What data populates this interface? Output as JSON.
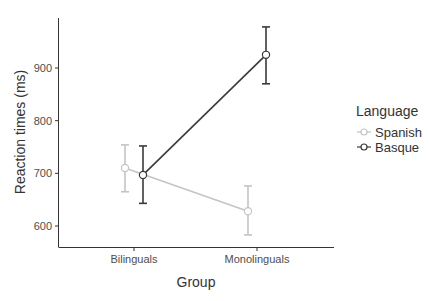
{
  "chart_data": {
    "type": "line",
    "title": "",
    "xlabel": "Group",
    "ylabel": "Reaction times (ms)",
    "categories": [
      "Bilinguals",
      "Monolinguals"
    ],
    "yticks": [
      600,
      700,
      800,
      900
    ],
    "ytick_labels": [
      "600",
      "700",
      "800",
      "900"
    ],
    "ylim": [
      560,
      990
    ],
    "grid": false,
    "legend_position": "right",
    "legend_title": "Language",
    "series": [
      {
        "name": "Spanish",
        "color": "#c4c4c4",
        "values": [
          710,
          628
        ],
        "error_low": [
          665,
          583
        ],
        "error_high": [
          754,
          676
        ]
      },
      {
        "name": "Basque",
        "color": "#3a3a3a",
        "values": [
          697,
          925
        ],
        "error_low": [
          643,
          870
        ],
        "error_high": [
          752,
          978
        ]
      }
    ]
  },
  "legend": {
    "title": "Language",
    "items": [
      {
        "label": "Spanish",
        "color": "#c4c4c4"
      },
      {
        "label": "Basque",
        "color": "#3a3a3a"
      }
    ]
  },
  "axes": {
    "x_title": "Group",
    "y_title": "Reaction times (ms)",
    "x_ticks": [
      "Bilinguals",
      "Monolinguals"
    ],
    "y_ticks": [
      "600",
      "700",
      "800",
      "900"
    ]
  }
}
